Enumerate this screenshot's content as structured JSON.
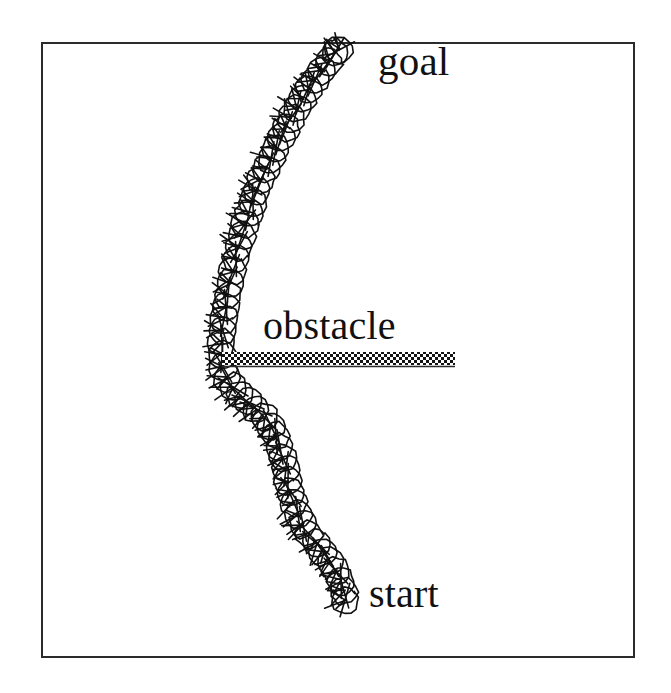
{
  "figure": {
    "kind": "robot-motion-planning-path-diagram",
    "background_color": "#ffffff",
    "ink_color": "#111111",
    "frame": {
      "name": "plot-border",
      "x": 41,
      "y": 42,
      "width": 594,
      "height": 616,
      "stroke_color": "#2b2b2b",
      "stroke_width": 2
    },
    "labels": {
      "goal": "goal",
      "obstacle": "obstacle",
      "start": "start"
    },
    "obstacle_bar": {
      "name": "obstacle-bar",
      "x1": 222,
      "y1": 359,
      "x2": 455,
      "y2": 359,
      "thickness": 13,
      "fill_pattern": "checkerboard-dither",
      "fill_color": "#1a1a1a",
      "pattern_cell_px": 3
    },
    "robot": {
      "body_shape": "circle",
      "radius": 13.5,
      "stroke_color": "#111111",
      "stroke_width": 1.6,
      "spoke_count": 3,
      "spoke_length": 17
    },
    "endpoints": {
      "start_point": [
        345,
        600
      ],
      "goal_point": [
        339,
        50
      ]
    },
    "path_points": [
      [
        339,
        50
      ],
      [
        335,
        53
      ],
      [
        329,
        62
      ],
      [
        322,
        71
      ],
      [
        315,
        80
      ],
      [
        309,
        89
      ],
      [
        303,
        99
      ],
      [
        297,
        108
      ],
      [
        291,
        118
      ],
      [
        286,
        128
      ],
      [
        281,
        138
      ],
      [
        276,
        148
      ],
      [
        271,
        159
      ],
      [
        266,
        169
      ],
      [
        261,
        180
      ],
      [
        257,
        191
      ],
      [
        253,
        202
      ],
      [
        249,
        213
      ],
      [
        245,
        224
      ],
      [
        242,
        236
      ],
      [
        239,
        247
      ],
      [
        236,
        259
      ],
      [
        233,
        271
      ],
      [
        230,
        283
      ],
      [
        228,
        295
      ],
      [
        226,
        307
      ],
      [
        224,
        319
      ],
      [
        223,
        331
      ],
      [
        222,
        343
      ],
      [
        222,
        355
      ],
      [
        223,
        367
      ],
      [
        227,
        378
      ],
      [
        233,
        387
      ],
      [
        240,
        395
      ],
      [
        248,
        402
      ],
      [
        256,
        409
      ],
      [
        264,
        417
      ],
      [
        271,
        426
      ],
      [
        276,
        436
      ],
      [
        280,
        447
      ],
      [
        283,
        458
      ],
      [
        286,
        469
      ],
      [
        288,
        481
      ],
      [
        291,
        492
      ],
      [
        294,
        503
      ],
      [
        298,
        514
      ],
      [
        303,
        524
      ],
      [
        309,
        534
      ],
      [
        316,
        543
      ],
      [
        323,
        552
      ],
      [
        330,
        561
      ],
      [
        336,
        571
      ],
      [
        341,
        581
      ],
      [
        344,
        591
      ],
      [
        345,
        600
      ]
    ]
  }
}
